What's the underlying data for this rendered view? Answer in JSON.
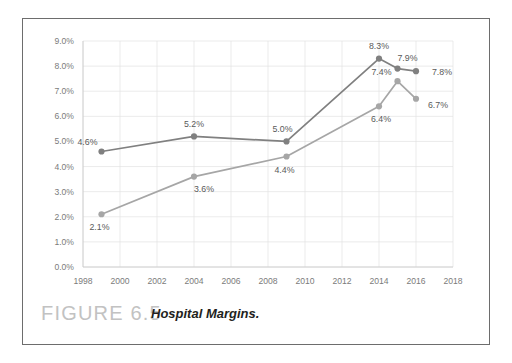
{
  "figure": {
    "number": "FIGURE 6.5",
    "caption": "Hospital Margins."
  },
  "colors": {
    "total_margin": "#808080",
    "operating_margin": "#a6a6a6",
    "gridline": "#e3e3e3",
    "axis_text": "#7b7b7b",
    "data_label": "#5a5a5a",
    "frame_border": "#6d6d6d",
    "figure_number": "#c2c2c2",
    "caption_text": "#231f20"
  },
  "chart_data": {
    "type": "line",
    "title": "",
    "xlabel": "",
    "ylabel": "",
    "xlim": [
      1998,
      2018
    ],
    "ylim": [
      0.0,
      9.0
    ],
    "ytick_labels": [
      "9.0%",
      "8.0%",
      "7.0%",
      "6.0%",
      "5.0%",
      "4.0%",
      "3.0%",
      "2.0%",
      "1.0%",
      "0.0%"
    ],
    "ytick_values": [
      9.0,
      8.0,
      7.0,
      6.0,
      5.0,
      4.0,
      3.0,
      2.0,
      1.0,
      0.0
    ],
    "xtick_labels": [
      "1998",
      "2000",
      "2002",
      "2004",
      "2006",
      "2008",
      "2010",
      "2012",
      "2014",
      "2016",
      "2018"
    ],
    "xtick_values": [
      1998,
      2000,
      2002,
      2004,
      2006,
      2008,
      2010,
      2012,
      2014,
      2016,
      2018
    ],
    "grid": true,
    "legend_position": "bottom",
    "x": [
      1999,
      2004,
      2009,
      2014,
      2015,
      2016
    ],
    "series": [
      {
        "name": "Total margin",
        "color": "#808080",
        "x": [
          1999,
          2004,
          2009,
          2014,
          2015,
          2016
        ],
        "values": [
          4.6,
          5.2,
          5.0,
          8.3,
          7.9,
          7.8
        ],
        "labels": [
          "4.6%",
          "5.2%",
          "5.0%",
          "8.3%",
          "7.9%",
          "7.8%"
        ]
      },
      {
        "name": "Operating margin",
        "color": "#a6a6a6",
        "x": [
          1999,
          2004,
          2009,
          2014,
          2015,
          2016
        ],
        "values": [
          2.1,
          3.6,
          4.4,
          6.4,
          7.4,
          6.7
        ],
        "labels": [
          "2.1%",
          "3.6%",
          "4.4%",
          "6.4%",
          "7.4%",
          "6.7%"
        ]
      }
    ]
  },
  "legend": {
    "items": [
      {
        "label": "Total margin",
        "color": "#808080"
      },
      {
        "label": "Operating margin",
        "color": "#a6a6a6"
      }
    ]
  }
}
